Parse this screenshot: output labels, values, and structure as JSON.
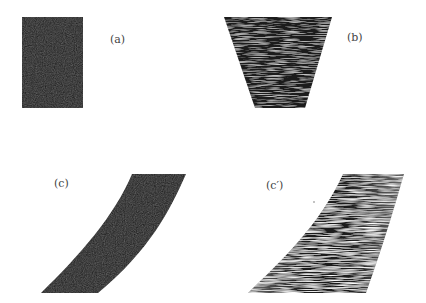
{
  "panels": {
    "a": {
      "label": "(a)",
      "shape": "rectangle",
      "fill": "#1c1c1c"
    },
    "b": {
      "label": "(b)",
      "shape": "trapezoid-noisy",
      "fill": "#1e1e1e"
    },
    "c": {
      "label": "(c)",
      "shape": "curved-band",
      "fill": "#1a1a1a"
    },
    "c_prime": {
      "label": "(c′)",
      "shape": "curved-band-noisy",
      "fill": "#2a2a2a"
    }
  },
  "colors": {
    "background": "#ffffff",
    "ink": "#1c1c1c",
    "noise": "#8a8a8a"
  }
}
